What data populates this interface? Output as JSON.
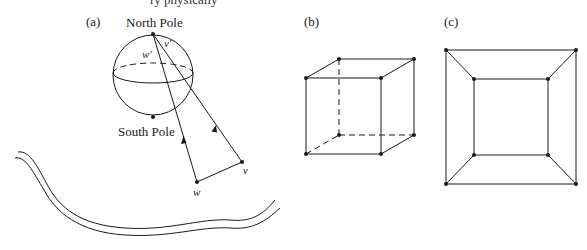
{
  "top_text_fragment": "ry physically",
  "panels": {
    "a": {
      "label": "(a)",
      "north_pole_label": "North Pole",
      "south_pole_label": "South Pole",
      "point_w_label": "w",
      "point_v_label": "v",
      "point_w_prime_label": "w′",
      "point_v_prime_label": "v′"
    },
    "b": {
      "label": "(b)"
    },
    "c": {
      "label": "(c)"
    }
  },
  "colors": {
    "ink": "#1a1a1a",
    "background": "#ffffff"
  }
}
